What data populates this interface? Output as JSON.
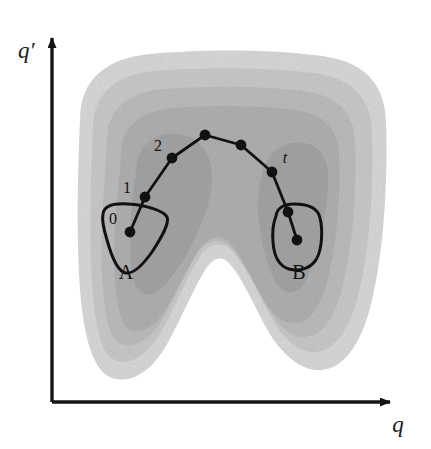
{
  "figure": {
    "background_color": "#ffffff",
    "width": 431,
    "height": 449
  },
  "axes": {
    "x_label": "q",
    "y_label": "q′",
    "color": "#141414",
    "origin": {
      "x": 52,
      "y": 402
    },
    "x_end": {
      "x": 398,
      "y": 402
    },
    "y_end": {
      "x": 52,
      "y": 30
    },
    "style": "arrow"
  },
  "contours": {
    "description": "Nested grayscale potential-energy contour bands forming a two-lobed horseshoe with a V-shaped notch at the bottom center",
    "levels": [
      {
        "name": "band-1-outermost",
        "color": "#d8d8d8"
      },
      {
        "name": "band-2",
        "color": "#c9c9c9"
      },
      {
        "name": "band-3",
        "color": "#bcbcbc"
      },
      {
        "name": "band-4",
        "color": "#b0b0b0"
      },
      {
        "name": "band-5-innermost",
        "color": "#a4a4a4"
      }
    ]
  },
  "regions": [
    {
      "id": "A",
      "label": "A",
      "label_pos": {
        "x": 126,
        "y": 272
      },
      "shape": "teardrop",
      "center": {
        "x": 130,
        "y": 232
      },
      "stroke": "#111111"
    },
    {
      "id": "B",
      "label": "B",
      "label_pos": {
        "x": 299,
        "y": 272
      },
      "shape": "rounded-blob",
      "center": {
        "x": 297,
        "y": 240
      },
      "stroke": "#111111"
    }
  ],
  "trajectory": {
    "name": "transition-path",
    "stroke": "#111111",
    "stroke_width": 2.6,
    "dot_radius": 5,
    "points": [
      {
        "label": "0",
        "x": 130,
        "y": 232,
        "label_pos": {
          "x": 113,
          "y": 218
        },
        "italic": false
      },
      {
        "label": "1",
        "x": 145,
        "y": 197,
        "label_pos": {
          "x": 127,
          "y": 188
        },
        "italic": false
      },
      {
        "label": "2",
        "x": 172,
        "y": 158,
        "label_pos": {
          "x": 158,
          "y": 146
        },
        "italic": false
      },
      {
        "label": "",
        "x": 205,
        "y": 135,
        "label_pos": null,
        "italic": false
      },
      {
        "label": "",
        "x": 241,
        "y": 145,
        "label_pos": null,
        "italic": false
      },
      {
        "label": "",
        "x": 272,
        "y": 172,
        "label_pos": null,
        "italic": false
      },
      {
        "label": "t",
        "x": 288,
        "y": 212,
        "label_pos": {
          "x": 285,
          "y": 158
        },
        "italic": true
      },
      {
        "label": "",
        "x": 297,
        "y": 240,
        "label_pos": null,
        "italic": false
      }
    ]
  }
}
